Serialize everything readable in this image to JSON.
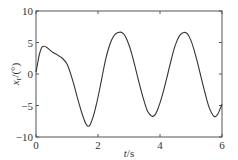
{
  "chart_data": {
    "type": "line",
    "title": "",
    "xlabel": "t/s",
    "xlabel_var": "t",
    "xlabel_unit": "/s",
    "ylabel": "x_r/(°)",
    "ylabel_var": "x",
    "ylabel_sub": "r",
    "ylabel_unit": "/(°)",
    "xlim": [
      0,
      6
    ],
    "ylim": [
      -10,
      10
    ],
    "xticks": [
      0,
      2,
      4,
      6
    ],
    "yticks": [
      10,
      5,
      0,
      -5,
      -10
    ],
    "xtick_labels": [
      "0",
      "2",
      "4",
      "6"
    ],
    "ytick_labels": [
      "10",
      "5",
      "0",
      "−5",
      "−10"
    ],
    "grid": false,
    "legend": null,
    "series": [
      {
        "name": "x_r",
        "color": "#333333",
        "x": [
          0.0,
          0.05,
          0.1,
          0.15,
          0.2,
          0.26,
          0.35,
          0.45,
          0.55,
          0.7,
          0.85,
          1.0,
          1.1,
          1.2,
          1.3,
          1.4,
          1.5,
          1.6,
          1.68,
          1.75,
          1.85,
          1.95,
          2.05,
          2.15,
          2.25,
          2.35,
          2.45,
          2.55,
          2.65,
          2.77,
          2.88,
          3.0,
          3.1,
          3.2,
          3.3,
          3.4,
          3.5,
          3.6,
          3.74,
          3.85,
          3.95,
          4.05,
          4.15,
          4.25,
          4.35,
          4.45,
          4.55,
          4.65,
          4.77,
          4.88,
          5.0,
          5.1,
          5.2,
          5.3,
          5.4,
          5.5,
          5.6,
          5.74,
          5.85,
          5.95,
          6.0
        ],
        "y": [
          0.3,
          1.6,
          2.9,
          3.8,
          4.3,
          4.4,
          4.2,
          3.8,
          3.4,
          3.0,
          2.5,
          1.6,
          0.3,
          -1.3,
          -3.1,
          -4.9,
          -6.5,
          -7.8,
          -8.3,
          -8.0,
          -6.7,
          -4.8,
          -2.5,
          0.0,
          2.4,
          4.2,
          5.5,
          6.3,
          6.6,
          6.6,
          6.0,
          4.6,
          3.0,
          1.1,
          -0.9,
          -2.8,
          -4.5,
          -5.9,
          -6.7,
          -6.4,
          -5.3,
          -3.8,
          -2.0,
          0.0,
          2.0,
          3.9,
          5.3,
          6.2,
          6.6,
          6.4,
          5.3,
          3.8,
          2.0,
          0.0,
          -2.0,
          -3.9,
          -5.5,
          -6.7,
          -6.5,
          -5.4,
          -4.8
        ]
      }
    ]
  },
  "axes": {
    "x_label_text": "t",
    "x_label_unit": "/s",
    "y_label_var": "x",
    "y_label_sub": "r",
    "y_label_unit": "/(°)"
  },
  "colors": {
    "axis": "#555555",
    "line": "#333333",
    "text": "#333333",
    "background": "#ffffff"
  }
}
